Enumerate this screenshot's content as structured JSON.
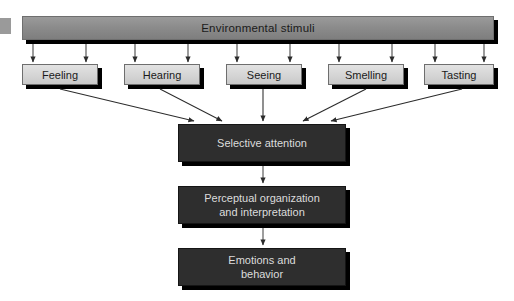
{
  "diagram": {
    "title": "Environmental stimuli",
    "top_bar": {
      "label": "Environmental stimuli",
      "fill_color": "#8c8c8c",
      "border_color": "#6e6e6e",
      "x": 22,
      "y": 16,
      "width": 472,
      "height": 24
    },
    "senses": [
      {
        "label": "Feeling",
        "x": 22,
        "y": 64,
        "width": 76,
        "height": 21
      },
      {
        "label": "Hearing",
        "x": 124,
        "y": 64,
        "width": 76,
        "height": 21
      },
      {
        "label": "Seeing",
        "x": 226,
        "y": 64,
        "width": 76,
        "height": 21
      },
      {
        "label": "Smelling",
        "x": 328,
        "y": 64,
        "width": 76,
        "height": 21
      },
      {
        "label": "Tasting",
        "x": 424,
        "y": 64,
        "width": 70,
        "height": 21
      }
    ],
    "stages": [
      {
        "label": "Selective attention",
        "x": 178,
        "y": 124,
        "width": 168,
        "height": 38
      },
      {
        "label": "Perceptual organization\nand interpretation",
        "x": 178,
        "y": 186,
        "width": 168,
        "height": 38
      },
      {
        "label": "Emotions and\nbehavior",
        "x": 178,
        "y": 248,
        "width": 168,
        "height": 38
      }
    ],
    "colors": {
      "light_box": "#d6d6d6",
      "dark_box": "#2e2e2e",
      "bar": "#8c8c8c",
      "shadow": "#000000",
      "dark_text": "#dcdcdc",
      "light_text": "#1a1a1a",
      "arrow": "#3a3a3a"
    },
    "flow": {
      "stimuli_to_senses_arrow_count": 10,
      "senses_to_attention": [
        "Feeling",
        "Hearing",
        "Seeing",
        "Smelling",
        "Tasting"
      ],
      "sequence": [
        "Selective attention",
        "Perceptual organization and interpretation",
        "Emotions and behavior"
      ]
    }
  }
}
